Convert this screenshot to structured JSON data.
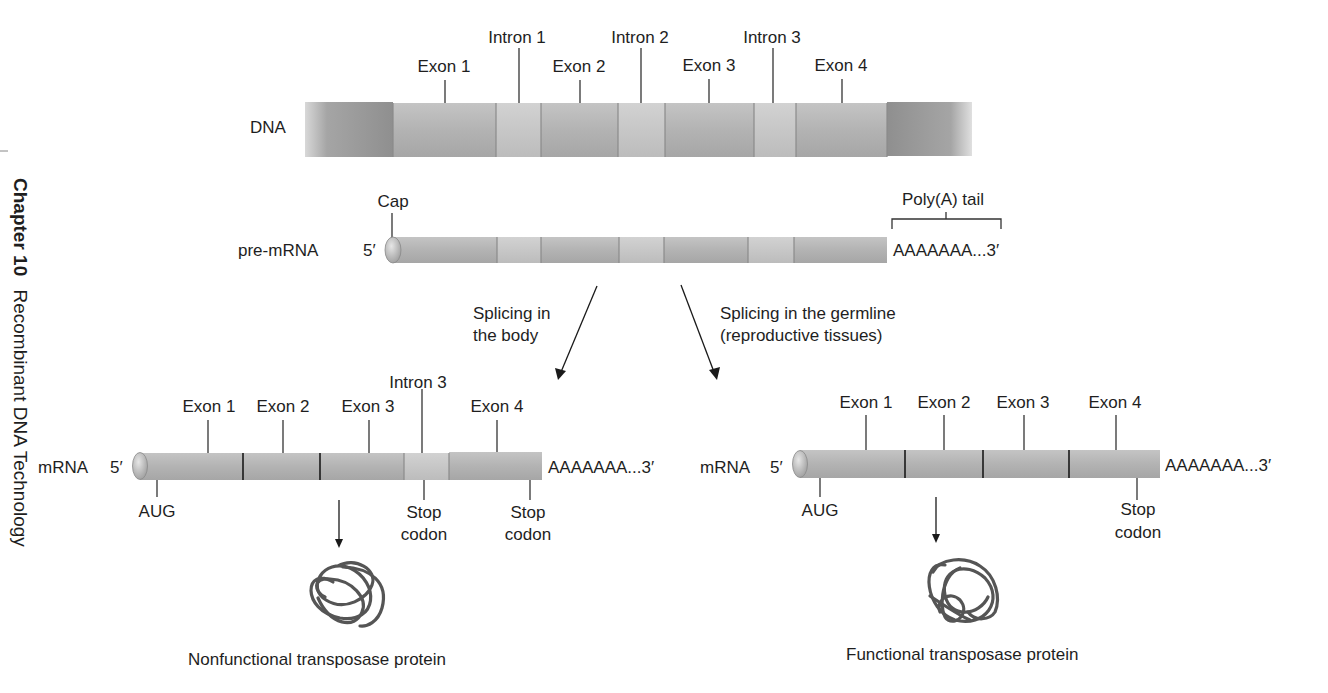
{
  "side_header": {
    "chapter": "Chapter 10",
    "title": "Recombinant DNA Technology"
  },
  "dna": {
    "label": "DNA",
    "segments": [
      {
        "type": "exon",
        "label": "Exon 1"
      },
      {
        "type": "intron",
        "label": "Intron 1"
      },
      {
        "type": "exon",
        "label": "Exon 2"
      },
      {
        "type": "intron",
        "label": "Intron 2"
      },
      {
        "type": "exon",
        "label": "Exon 3"
      },
      {
        "type": "intron",
        "label": "Intron 3"
      },
      {
        "type": "exon",
        "label": "Exon 4"
      }
    ]
  },
  "pre_mrna": {
    "label": "pre-mRNA",
    "five_prime": "5′",
    "cap_label": "Cap",
    "polya_label": "Poly(A) tail",
    "tail_text": "AAAAAAA...3′"
  },
  "pathways": {
    "body": {
      "line1": "Splicing in",
      "line2": "the body"
    },
    "germline": {
      "line1": "Splicing in the germline",
      "line2": "(reproductive tissues)"
    }
  },
  "mrna_body": {
    "label": "mRNA",
    "five_prime": "5′",
    "tail_text": "AAAAAAA...3′",
    "top_labels": [
      "Exon 1",
      "Exon 2",
      "Exon 3",
      "Intron 3",
      "Exon 4"
    ],
    "start_label": "AUG",
    "stop1_line1": "Stop",
    "stop1_line2": "codon",
    "stop2_line1": "Stop",
    "stop2_line2": "codon",
    "protein_label": "Nonfunctional transposase protein"
  },
  "mrna_germline": {
    "label": "mRNA",
    "five_prime": "5′",
    "tail_text": "AAAAAAA...3′",
    "top_labels": [
      "Exon 1",
      "Exon 2",
      "Exon 3",
      "Exon 4"
    ],
    "start_label": "AUG",
    "stop_line1": "Stop",
    "stop_line2": "codon",
    "protein_label": "Functional transposase protein"
  },
  "colors": {
    "exon": "#b3b3b3",
    "intron": "#c6c6c6",
    "flank": "#9c9c9c",
    "cap": "#bdbdbd",
    "protein": "#555555"
  }
}
